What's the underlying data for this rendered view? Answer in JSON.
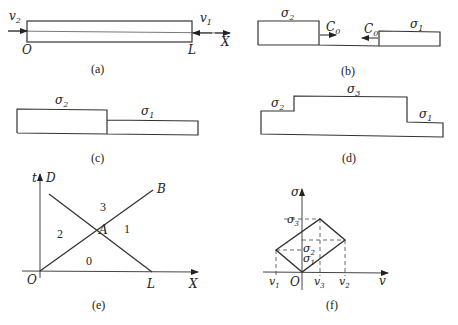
{
  "panels": {
    "a": {
      "caption": "(a)",
      "labels": {
        "left_velocity": "v",
        "left_velocity_sub": "2",
        "right_velocity": "v",
        "right_velocity_sub": "1",
        "origin": "O",
        "end": "L",
        "axis": "X"
      }
    },
    "b": {
      "caption": "(b)",
      "labels": {
        "left_stress": "σ",
        "left_stress_sub": "2",
        "right_stress": "σ",
        "right_stress_sub": "1",
        "left_wave": "C",
        "left_wave_sub": "0",
        "right_wave": "C",
        "right_wave_sub": "0"
      }
    },
    "c": {
      "caption": "(c)",
      "labels": {
        "left_stress": "σ",
        "left_stress_sub": "2",
        "right_stress": "σ",
        "right_stress_sub": "1"
      }
    },
    "d": {
      "caption": "(d)",
      "labels": {
        "left_stress": "σ",
        "left_stress_sub": "2",
        "mid_stress": "σ",
        "mid_stress_sub": "3",
        "right_stress": "σ",
        "right_stress_sub": "1"
      }
    },
    "e": {
      "caption": "(e)",
      "labels": {
        "t_axis": "t",
        "x_axis": "X",
        "origin": "O",
        "end": "L",
        "point_d": "D",
        "point_b": "B",
        "point_a": "A"
      },
      "regions": [
        "0",
        "1",
        "2",
        "3"
      ]
    },
    "f": {
      "caption": "(f)",
      "labels": {
        "sigma_axis": "σ",
        "v_axis": "v",
        "origin": "O",
        "sigma3": "σ",
        "sigma3_sub": "3",
        "sigma2": "σ",
        "sigma2_sub": "2",
        "sigma1": "σ",
        "sigma1_sub": "1",
        "v1": "v",
        "v1_sub": "1",
        "v3": "v",
        "v3_sub": "3",
        "v2": "v",
        "v2_sub": "2"
      }
    }
  }
}
